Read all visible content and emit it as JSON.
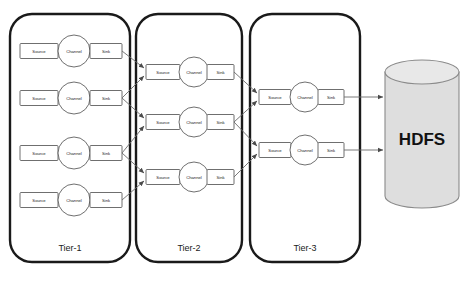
{
  "diagram": {
    "node_labels": {
      "source": "Source",
      "channel": "Channel",
      "sink": "Sink"
    },
    "colors": {
      "tier_border": "#1a1a1a",
      "node_stroke": "#4a4a4a",
      "arrow": "#6b6b6b",
      "cylinder_fill": "#dedede",
      "cylinder_top": "#e8e8e8",
      "cylinder_stroke": "#8a8a8a",
      "text": "#1a1a1a",
      "background": "#ffffff"
    },
    "tiers": [
      {
        "id": "tier-1",
        "label": "Tier-1",
        "x": 10,
        "y": 14,
        "width": 120,
        "height": 248,
        "label_x": 70,
        "label_y": 248,
        "agent_count": 4,
        "agents": [
          {
            "id": "tier1-agent-1",
            "y": 51
          },
          {
            "id": "tier1-agent-2",
            "y": 98
          },
          {
            "id": "tier1-agent-3",
            "y": 153
          },
          {
            "id": "tier1-agent-4",
            "y": 200
          }
        ]
      },
      {
        "id": "tier-2",
        "label": "Tier-2",
        "x": 136,
        "y": 14,
        "width": 106,
        "height": 248,
        "label_x": 189,
        "label_y": 248,
        "agent_count": 3,
        "agents": [
          {
            "id": "tier2-agent-1",
            "y": 72
          },
          {
            "id": "tier2-agent-2",
            "y": 122
          },
          {
            "id": "tier2-agent-3",
            "y": 177
          }
        ]
      },
      {
        "id": "tier-3",
        "label": "Tier-3",
        "x": 250,
        "y": 14,
        "width": 110,
        "height": 248,
        "label_x": 305,
        "label_y": 248,
        "agent_count": 2,
        "agents": [
          {
            "id": "tier3-agent-1",
            "y": 97
          },
          {
            "id": "tier3-agent-2",
            "y": 150
          }
        ]
      }
    ],
    "storage": {
      "id": "hdfs-store",
      "label": "HDFS",
      "center_x": 422,
      "center_y": 138,
      "top_y": 72,
      "bottom_y": 196,
      "radius_x": 37,
      "radius_y": 12
    }
  }
}
